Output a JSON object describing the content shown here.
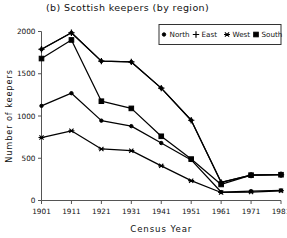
{
  "chart_data": {
    "type": "line",
    "title": "(b) Scottish keepers (by region)",
    "xlabel": "Census Year",
    "ylabel": "Number of keepers",
    "x": [
      1901,
      1911,
      1921,
      1931,
      1941,
      1951,
      1961,
      1971,
      1981
    ],
    "xticklabels": [
      "1901",
      "1911",
      "1921",
      "1931",
      "1941",
      "1951",
      "1961",
      "1971",
      "1981"
    ],
    "yticklabels": [
      "0",
      "500",
      "1000",
      "1500",
      "2000"
    ],
    "yticks": [
      0,
      500,
      1000,
      1500,
      2000
    ],
    "xlim": [
      1901,
      1981
    ],
    "ylim": [
      0,
      2000
    ],
    "grid": false,
    "legend_position": "top-right",
    "series": [
      {
        "name": "North",
        "marker": "dot",
        "values": [
          1790,
          1985,
          1650,
          1640,
          1330,
          950,
          215,
          300,
          305
        ]
      },
      {
        "name": "East",
        "marker": "plus",
        "values": [
          1790,
          1985,
          1650,
          1640,
          1330,
          950,
          215,
          300,
          305
        ]
      },
      {
        "name": "West",
        "marker": "asterisk",
        "values": [
          745,
          825,
          610,
          590,
          410,
          235,
          95,
          100,
          115
        ]
      },
      {
        "name": "South",
        "marker": "square",
        "values": [
          1680,
          1900,
          1175,
          1090,
          760,
          490,
          190,
          300,
          305
        ]
      }
    ],
    "series_extra": [
      {
        "name": "North-actual",
        "marker": "dot",
        "values": [
          1120,
          1270,
          945,
          880,
          680,
          480,
          100,
          110,
          120
        ]
      }
    ]
  },
  "legend": {
    "items": [
      {
        "label": "North",
        "marker": "dot"
      },
      {
        "label": "East",
        "marker": "plus"
      },
      {
        "label": "West",
        "marker": "asterisk"
      },
      {
        "label": "South",
        "marker": "square"
      }
    ]
  }
}
